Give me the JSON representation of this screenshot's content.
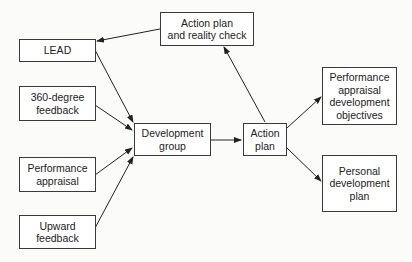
{
  "diagram": {
    "type": "flowchart",
    "nodes": [
      {
        "id": "action_reality",
        "label": "Action plan\nand reality check"
      },
      {
        "id": "lead",
        "label": "LEAD"
      },
      {
        "id": "feedback360",
        "label": "360-degree\nfeedback"
      },
      {
        "id": "perf_appraisal",
        "label": "Performance\nappraisal"
      },
      {
        "id": "upward",
        "label": "Upward\nfeedback"
      },
      {
        "id": "dev_group",
        "label": "Development\ngroup"
      },
      {
        "id": "action_plan",
        "label": "Action\nplan"
      },
      {
        "id": "pa_dev_obj",
        "label": "Performance\nappraisal\ndevelopment\nobjectives"
      },
      {
        "id": "personal_dev",
        "label": "Personal\ndevelopment\nplan"
      }
    ],
    "edges": [
      {
        "from": "action_reality",
        "to": "lead"
      },
      {
        "from": "lead",
        "to": "dev_group"
      },
      {
        "from": "feedback360",
        "to": "dev_group"
      },
      {
        "from": "perf_appraisal",
        "to": "dev_group"
      },
      {
        "from": "upward",
        "to": "dev_group"
      },
      {
        "from": "dev_group",
        "to": "action_plan"
      },
      {
        "from": "action_plan",
        "to": "action_reality"
      },
      {
        "from": "action_plan",
        "to": "pa_dev_obj"
      },
      {
        "from": "action_plan",
        "to": "personal_dev"
      }
    ]
  }
}
